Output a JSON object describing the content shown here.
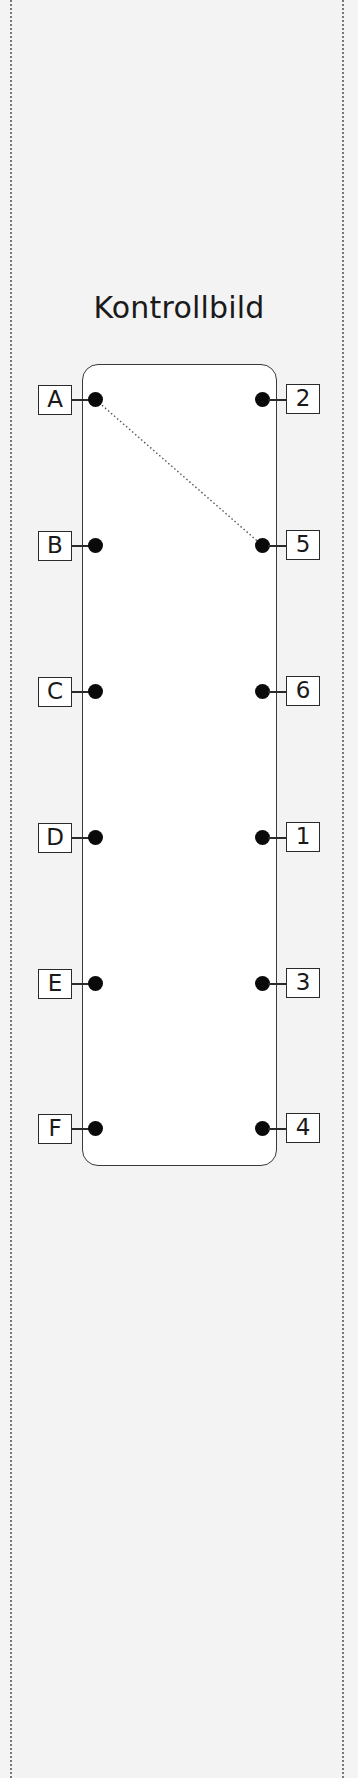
{
  "title": "Kontrollbild",
  "left_terminals": [
    {
      "label": "A"
    },
    {
      "label": "B"
    },
    {
      "label": "C"
    },
    {
      "label": "D"
    },
    {
      "label": "E"
    },
    {
      "label": "F"
    }
  ],
  "right_terminals": [
    {
      "label": "2"
    },
    {
      "label": "5"
    },
    {
      "label": "6"
    },
    {
      "label": "1"
    },
    {
      "label": "3"
    },
    {
      "label": "4"
    }
  ],
  "connections": [
    {
      "from": "A",
      "to": "5",
      "style": "dotted"
    }
  ],
  "colors": {
    "background": "#f3f3f3",
    "panel": "#ffffff",
    "ink": "#1a1a1a"
  }
}
